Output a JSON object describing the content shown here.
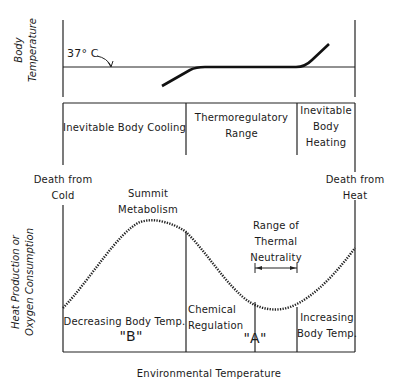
{
  "top_panel": {
    "y_axis_label_line1": "Body",
    "y_axis_label_line2": "Temperature",
    "reference_label": "37° C"
  },
  "zones": {
    "cooling": "Inevitable Body Cooling",
    "thermoregulatory_line1": "Thermoregulatory",
    "thermoregulatory_line2": "Range",
    "heating_line1": "Inevitable",
    "heating_line2": "Body",
    "heating_line3": "Heating"
  },
  "limits": {
    "cold_line1": "Death from",
    "cold_line2": "Cold",
    "heat_line1": "Death from",
    "heat_line2": "Heat"
  },
  "bottom_panel": {
    "y_axis_label_line1": "Heat Production or",
    "y_axis_label_line2": "Oxygen Consumption",
    "summit_line1": "Summit",
    "summit_line2": "Metabolism",
    "neutrality_line1": "Range of",
    "neutrality_line2": "Thermal",
    "neutrality_line3": "Neutrality",
    "decreasing": "Decreasing Body Temp.",
    "marker_b": "\"B\"",
    "chemical_line1": "Chemical",
    "chemical_line2": "Regulation",
    "marker_a": "\"A\"",
    "increasing_line1": "Increasing",
    "increasing_line2": "Body Temp."
  },
  "x_axis_label": "Environmental Temperature"
}
